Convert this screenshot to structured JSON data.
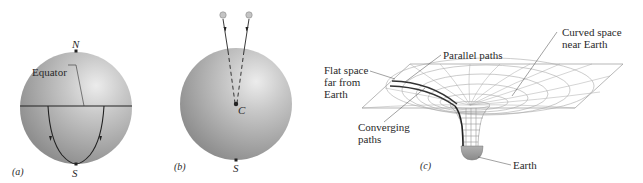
{
  "panels": {
    "a": {
      "tag": "(a)",
      "north_label": "N",
      "south_label": "S",
      "equator_label": "Equator"
    },
    "b": {
      "tag": "(b)",
      "center_label": "C",
      "south_label": "S"
    },
    "c": {
      "tag": "(c)",
      "flat_space_label": [
        "Flat space",
        "far from",
        "Earth"
      ],
      "parallel_paths_label": "Parallel paths",
      "curved_space_label": [
        "Curved space",
        "near Earth"
      ],
      "converging_paths_label": [
        "Converging",
        "paths"
      ],
      "earth_label": "Earth"
    }
  },
  "colors": {
    "sphere_light": "#e6e6e6",
    "sphere_mid": "#b4b4b4",
    "sphere_dark": "#8f8f8f",
    "line": "#222222",
    "grid": "#a8a8a8",
    "earth": "#9a9a9a"
  }
}
